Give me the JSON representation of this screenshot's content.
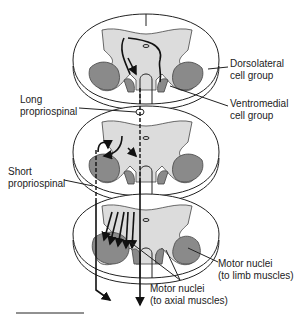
{
  "labels": {
    "dorsolateral": [
      "Dorsolateral",
      "cell group"
    ],
    "ventromedial": [
      "Ventromedial",
      "cell group"
    ],
    "long_propriospinal": [
      "Long",
      "propriospinal"
    ],
    "short_propriospinal": [
      "Short",
      "propriospinal"
    ],
    "motor_limb": [
      "Motor nuclei",
      "(to limb muscles)"
    ],
    "motor_axial": [
      "Motor nuclei",
      "(to axial muscles)"
    ]
  },
  "segments": [
    "upper",
    "middle",
    "lower"
  ]
}
